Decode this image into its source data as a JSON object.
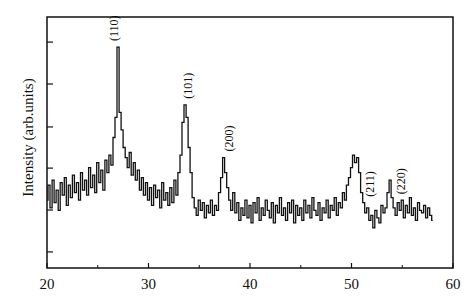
{
  "chart_data": {
    "type": "line",
    "title": "",
    "xlabel": "",
    "ylabel": "Intensity (arb.units)",
    "xlim": [
      20,
      60
    ],
    "ylim": [
      0,
      100
    ],
    "x_ticks": [
      20,
      30,
      40,
      50,
      60
    ],
    "x_minor_ticks": [
      25,
      35,
      45,
      55
    ],
    "y_ticks_unlabeled": [
      6.4,
      23.1,
      39.8,
      56.2,
      73.3,
      90.0
    ],
    "grid": false,
    "legend": "none",
    "series": [
      {
        "name": "XRD pattern",
        "x_start": 20,
        "x_step": 0.2,
        "values": [
          27,
          33,
          24,
          35,
          26,
          31,
          23,
          34,
          29,
          36,
          25,
          33,
          28,
          37,
          30,
          34,
          27,
          38,
          31,
          35,
          29,
          40,
          32,
          37,
          30,
          42,
          34,
          39,
          31,
          43,
          38,
          45,
          41,
          52,
          60,
          88,
          62,
          55,
          48,
          44,
          40,
          46,
          37,
          42,
          35,
          39,
          31,
          36,
          29,
          34,
          27,
          32,
          25,
          33,
          28,
          31,
          24,
          34,
          27,
          30,
          25,
          32,
          26,
          35,
          29,
          38,
          45,
          58,
          65,
          60,
          48,
          38,
          28,
          24,
          21,
          27,
          23,
          26,
          20,
          25,
          22,
          27,
          21,
          25,
          23,
          30,
          36,
          44,
          38,
          32,
          27,
          23,
          30,
          22,
          26,
          19,
          24,
          21,
          27,
          20,
          25,
          18,
          26,
          22,
          28,
          19,
          24,
          21,
          27,
          23,
          20,
          26,
          18,
          25,
          22,
          28,
          21,
          24,
          19,
          26,
          22,
          27,
          18,
          25,
          21,
          24,
          19,
          27,
          22,
          25,
          20,
          28,
          23,
          21,
          26,
          19,
          24,
          22,
          27,
          20,
          25,
          23,
          28,
          21,
          26,
          24,
          30,
          27,
          33,
          36,
          40,
          45,
          42,
          44,
          38,
          30,
          26,
          22,
          24,
          19,
          21,
          16,
          23,
          20,
          18,
          25,
          22,
          24,
          30,
          35,
          28,
          24,
          21,
          26,
          23,
          27,
          20,
          25,
          22,
          28,
          21,
          24,
          19,
          26,
          23,
          22,
          25,
          20,
          24,
          21,
          19
        ]
      }
    ],
    "annotations": [
      {
        "text": "(110)",
        "x": 26.6
      },
      {
        "text": "(101)",
        "x": 33.9
      },
      {
        "text": "(200)",
        "x": 37.9
      },
      {
        "text": "(211)",
        "x": 51.8
      },
      {
        "text": "(220)",
        "x": 54.9
      }
    ]
  }
}
